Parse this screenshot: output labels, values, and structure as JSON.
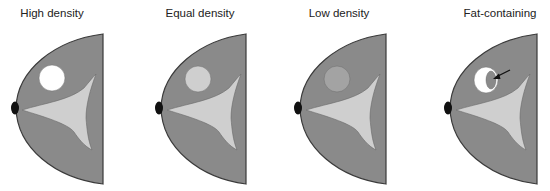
{
  "figure": {
    "colors": {
      "breast_tissue": "#8a8a8a",
      "glandular_tissue": "#cfcfcf",
      "outline": "#3a3a3a",
      "nipple": "#111111",
      "background": "#ffffff"
    },
    "panels": [
      {
        "title": "High density",
        "lesion": {
          "type": "circle",
          "fill": "#ffffff",
          "description": "Lesion brighter than glandular tissue"
        }
      },
      {
        "title": "Equal density",
        "lesion": {
          "type": "circle",
          "fill": "#cfcfcf",
          "description": "Lesion same density as glandular tissue"
        }
      },
      {
        "title": "Low density",
        "lesion": {
          "type": "circle",
          "fill": "#a3a3a3",
          "description": "Lesion lower density than glandular tissue"
        }
      },
      {
        "title": "Fat-containing",
        "lesion": {
          "type": "fat-containing",
          "fill": "#ffffff",
          "inner_fill": "#8a8a8a",
          "has_arrow": true,
          "description": "White lesion with internal fat portion indicated by arrow"
        }
      }
    ]
  }
}
